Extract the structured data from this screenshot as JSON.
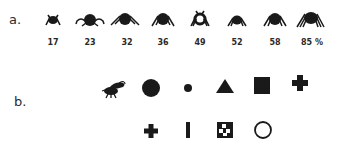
{
  "panel_a": {
    "label": "a.",
    "items": [
      {
        "icon": "spider-small-icon",
        "value": "17"
      },
      {
        "icon": "spider-wide-legs-icon",
        "value": "23"
      },
      {
        "icon": "spider-long-legs-icon",
        "value": "32"
      },
      {
        "icon": "spider-long-legs-icon",
        "value": "36"
      },
      {
        "icon": "spider-ring-body-icon",
        "value": "49"
      },
      {
        "icon": "spider-small-icon",
        "value": "52"
      },
      {
        "icon": "spider-medium-icon",
        "value": "58"
      },
      {
        "icon": "spider-many-legs-icon",
        "value": "85 %"
      }
    ]
  },
  "panel_b": {
    "label": "b.",
    "row1": [
      {
        "icon": "fly-icon"
      },
      {
        "icon": "large-filled-circle-icon"
      },
      {
        "icon": "small-dot-icon"
      },
      {
        "icon": "filled-triangle-icon"
      },
      {
        "icon": "filled-square-icon"
      },
      {
        "icon": "plus-cross-icon"
      }
    ],
    "row2": [
      {
        "icon": "small-plus-icon"
      },
      {
        "icon": "vertical-bar-icon"
      },
      {
        "icon": "checkered-square-icon"
      },
      {
        "icon": "open-circle-icon"
      }
    ]
  },
  "colors": {
    "ink": "#1a1a1a",
    "background": "#ffffff"
  }
}
